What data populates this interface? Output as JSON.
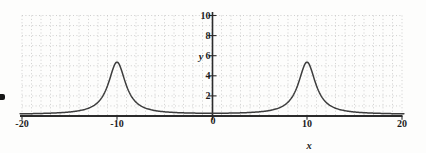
{
  "figure": {
    "xlabel": "x",
    "ylabel": "y",
    "x_ticks": [
      {
        "value": -20,
        "label": "-20"
      },
      {
        "value": -10,
        "label": "-10"
      },
      {
        "value": 0,
        "label": "0"
      },
      {
        "value": 10,
        "label": "10"
      },
      {
        "value": 20,
        "label": "20"
      }
    ],
    "y_ticks": [
      {
        "value": 2,
        "label": "2"
      },
      {
        "value": 4,
        "label": "4"
      },
      {
        "value": 6,
        "label": "6"
      },
      {
        "value": 8,
        "label": "8"
      },
      {
        "value": 10,
        "label": "10"
      }
    ],
    "colors": {
      "background": "#fdfdfc",
      "curve": "#3d3d3d",
      "axis": "#2b2b2b",
      "grid": "#c3c3c3",
      "text": "#1c1c1c"
    }
  },
  "chart_data": {
    "type": "line",
    "title": "",
    "xlabel": "x",
    "ylabel": "y",
    "xlim": [
      -20,
      20
    ],
    "ylim": [
      0,
      10
    ],
    "grid": "dotted minor grid, 1-unit spacing on both axes",
    "legend": "none",
    "x_tick_labels": [
      "-20",
      "-10",
      "0",
      "10",
      "20"
    ],
    "y_tick_labels": [
      "0",
      "2",
      "4",
      "6",
      "8",
      "10"
    ],
    "peaks": [
      {
        "x": -10,
        "y": 5.4
      },
      {
        "x": 10,
        "y": 5.4
      }
    ],
    "model": {
      "shape": "lorentzian_pair",
      "centers": [
        -10,
        10
      ],
      "amplitude": 5.2,
      "width": 1.1,
      "baseline": 0.15
    },
    "samples": [
      [
        -20,
        0.22
      ],
      [
        -19,
        0.23
      ],
      [
        -18,
        0.25
      ],
      [
        -17,
        0.28
      ],
      [
        -16,
        0.33
      ],
      [
        -15,
        0.4
      ],
      [
        -14,
        0.53
      ],
      [
        -13,
        0.78
      ],
      [
        -12,
        1.37
      ],
      [
        -11,
        3.01
      ],
      [
        -10,
        5.37
      ],
      [
        -9,
        3.01
      ],
      [
        -8,
        1.38
      ],
      [
        -7,
        0.79
      ],
      [
        -6,
        0.54
      ],
      [
        -5,
        0.42
      ],
      [
        -4,
        0.35
      ],
      [
        -3,
        0.31
      ],
      [
        -2,
        0.29
      ],
      [
        -1,
        0.28
      ],
      [
        0,
        0.28
      ],
      [
        1,
        0.28
      ],
      [
        2,
        0.29
      ],
      [
        3,
        0.31
      ],
      [
        4,
        0.35
      ],
      [
        5,
        0.42
      ],
      [
        6,
        0.54
      ],
      [
        7,
        0.79
      ],
      [
        8,
        1.38
      ],
      [
        9,
        3.01
      ],
      [
        10,
        5.37
      ],
      [
        11,
        3.01
      ],
      [
        12,
        1.37
      ],
      [
        13,
        0.78
      ],
      [
        14,
        0.53
      ],
      [
        15,
        0.4
      ],
      [
        16,
        0.33
      ],
      [
        17,
        0.28
      ],
      [
        18,
        0.25
      ],
      [
        19,
        0.23
      ],
      [
        20,
        0.22
      ]
    ]
  }
}
